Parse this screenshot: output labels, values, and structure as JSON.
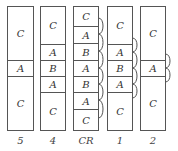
{
  "diagram": {
    "title": "",
    "columns": [
      {
        "label": "5",
        "x": 7,
        "w": 26,
        "segments": [
          {
            "text": "C",
            "y0": 6,
            "y1": 60
          },
          {
            "text": "A",
            "y0": 60,
            "y1": 76
          },
          {
            "text": "C",
            "y0": 76,
            "y1": 130
          }
        ],
        "links": []
      },
      {
        "label": "4",
        "x": 40,
        "w": 25,
        "segments": [
          {
            "text": "C",
            "y0": 6,
            "y1": 44
          },
          {
            "text": "A",
            "y0": 44,
            "y1": 60
          },
          {
            "text": "B",
            "y0": 60,
            "y1": 76
          },
          {
            "text": "A",
            "y0": 76,
            "y1": 92
          },
          {
            "text": "C",
            "y0": 92,
            "y1": 130
          }
        ],
        "links": []
      },
      {
        "label": "CR",
        "x": 73,
        "w": 25,
        "segments": [
          {
            "text": "C",
            "y0": 6,
            "y1": 26
          },
          {
            "text": "A",
            "y0": 26,
            "y1": 43
          },
          {
            "text": "B",
            "y0": 43,
            "y1": 60
          },
          {
            "text": "A",
            "y0": 60,
            "y1": 76
          },
          {
            "text": "B",
            "y0": 76,
            "y1": 92
          },
          {
            "text": "A",
            "y0": 92,
            "y1": 109
          },
          {
            "text": "C",
            "y0": 109,
            "y1": 130
          }
        ],
        "links": [
          {
            "y0": 18,
            "y1": 34
          },
          {
            "y0": 34,
            "y1": 51
          },
          {
            "y0": 51,
            "y1": 68
          },
          {
            "y0": 68,
            "y1": 84
          },
          {
            "y0": 84,
            "y1": 100
          },
          {
            "y0": 100,
            "y1": 118
          }
        ]
      },
      {
        "label": "1",
        "x": 107,
        "w": 25,
        "segments": [
          {
            "text": "C",
            "y0": 6,
            "y1": 44
          },
          {
            "text": "A",
            "y0": 44,
            "y1": 60
          },
          {
            "text": "B",
            "y0": 60,
            "y1": 76
          },
          {
            "text": "A",
            "y0": 76,
            "y1": 92
          },
          {
            "text": "C",
            "y0": 92,
            "y1": 130
          }
        ],
        "links": [
          {
            "y0": 38,
            "y1": 52
          },
          {
            "y0": 52,
            "y1": 68
          },
          {
            "y0": 68,
            "y1": 84
          },
          {
            "y0": 84,
            "y1": 98
          }
        ]
      },
      {
        "label": "2",
        "x": 140,
        "w": 25,
        "segments": [
          {
            "text": "C",
            "y0": 6,
            "y1": 60
          },
          {
            "text": "A",
            "y0": 60,
            "y1": 76
          },
          {
            "text": "C",
            "y0": 76,
            "y1": 130
          }
        ],
        "links": [
          {
            "y0": 54,
            "y1": 68
          },
          {
            "y0": 68,
            "y1": 82
          }
        ]
      }
    ],
    "label_y": 141,
    "colors": {
      "stroke": "#555555",
      "text": "#333333",
      "background": "#ffffff"
    }
  }
}
